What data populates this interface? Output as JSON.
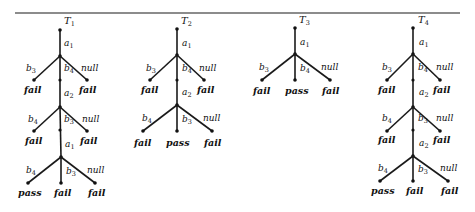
{
  "diagram": {
    "type": "test-trees",
    "colors": {
      "ink": "#111111",
      "background": "#ffffff"
    },
    "trees": [
      {
        "title": "T1",
        "title_main": "T",
        "title_sub": "1",
        "levels": [
          {
            "input": "a",
            "input_sub": "1",
            "branches": [
              {
                "label": "b",
                "label_sub": "3",
                "verdict": "fail"
              },
              {
                "label": "b",
                "label_sub": "4",
                "verdict": null
              },
              {
                "label": "null",
                "label_sub": "",
                "verdict": "fail"
              }
            ]
          },
          {
            "input": "a",
            "input_sub": "2",
            "branches": [
              {
                "label": "b",
                "label_sub": "4",
                "verdict": "fail"
              },
              {
                "label": "b",
                "label_sub": "3",
                "verdict": null
              },
              {
                "label": "null",
                "label_sub": "",
                "verdict": "fail"
              }
            ]
          },
          {
            "input": "a",
            "input_sub": "1",
            "branches": [
              {
                "label": "b",
                "label_sub": "4",
                "verdict": "pass"
              },
              {
                "label": "b",
                "label_sub": "3",
                "verdict": "fail"
              },
              {
                "label": "null",
                "label_sub": "",
                "verdict": "fail"
              }
            ]
          }
        ]
      },
      {
        "title": "T2",
        "title_main": "T",
        "title_sub": "2",
        "levels": [
          {
            "input": "a",
            "input_sub": "1",
            "branches": [
              {
                "label": "b",
                "label_sub": "3",
                "verdict": "fail"
              },
              {
                "label": "b",
                "label_sub": "4",
                "verdict": null
              },
              {
                "label": "null",
                "label_sub": "",
                "verdict": "fail"
              }
            ]
          },
          {
            "input": "a",
            "input_sub": "2",
            "branches": [
              {
                "label": "b",
                "label_sub": "4",
                "verdict": "fail"
              },
              {
                "label": "b",
                "label_sub": "3",
                "verdict": "pass"
              },
              {
                "label": "null",
                "label_sub": "",
                "verdict": "fail"
              }
            ]
          }
        ]
      },
      {
        "title": "T3",
        "title_main": "T",
        "title_sub": "3",
        "levels": [
          {
            "input": "a",
            "input_sub": "1",
            "branches": [
              {
                "label": "b",
                "label_sub": "3",
                "verdict": "fail"
              },
              {
                "label": "b",
                "label_sub": "4",
                "verdict": "pass"
              },
              {
                "label": "null",
                "label_sub": "",
                "verdict": "fail"
              }
            ]
          }
        ]
      },
      {
        "title": "T4",
        "title_main": "T",
        "title_sub": "4",
        "levels": [
          {
            "input": "a",
            "input_sub": "1",
            "branches": [
              {
                "label": "b",
                "label_sub": "3",
                "verdict": "fail"
              },
              {
                "label": "b",
                "label_sub": "4",
                "verdict": null
              },
              {
                "label": "null",
                "label_sub": "",
                "verdict": "fail"
              }
            ]
          },
          {
            "input": "a",
            "input_sub": "2",
            "branches": [
              {
                "label": "b",
                "label_sub": "4",
                "verdict": "fail"
              },
              {
                "label": "b",
                "label_sub": "3",
                "verdict": null
              },
              {
                "label": "null",
                "label_sub": "",
                "verdict": "fail"
              }
            ]
          },
          {
            "input": "a",
            "input_sub": "2",
            "branches": [
              {
                "label": "b",
                "label_sub": "4",
                "verdict": "pass"
              },
              {
                "label": "b",
                "label_sub": "3",
                "verdict": "fail"
              },
              {
                "label": "null",
                "label_sub": "",
                "verdict": "fail"
              }
            ]
          }
        ]
      }
    ]
  }
}
